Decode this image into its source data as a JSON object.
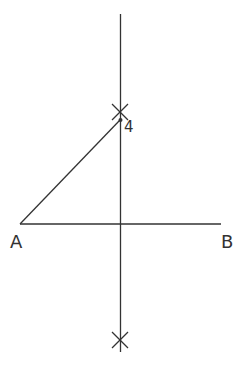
{
  "diagram": {
    "type": "geometric-construction",
    "colors": {
      "stroke": "#333333",
      "background": "#ffffff"
    },
    "points": {
      "A": {
        "label": "A",
        "x": 20,
        "y": 224
      },
      "B": {
        "label": "B",
        "x": 221,
        "y": 224
      },
      "P4": {
        "label": "4",
        "x": 120,
        "y": 120
      },
      "midpoint": {
        "x": 121,
        "y": 224
      },
      "arc_top": {
        "x": 120,
        "y": 112
      },
      "arc_bottom": {
        "x": 120,
        "y": 340
      }
    },
    "segments": [
      {
        "name": "segment-AB",
        "from": "A",
        "to": "B"
      },
      {
        "name": "segment-A-4",
        "from": "A",
        "to": "P4"
      },
      {
        "name": "perpendicular-bisector",
        "x": 120,
        "y1": 14,
        "y2": 352
      }
    ],
    "labels": {
      "A": "A",
      "B": "B",
      "point4": "4"
    }
  }
}
